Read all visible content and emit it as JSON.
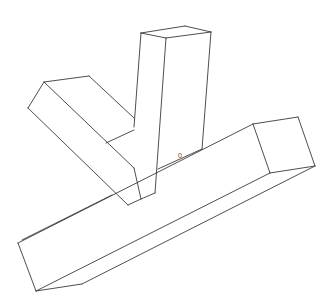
{
  "diagram": {
    "type": "line-drawing",
    "background": "#ffffff",
    "stroke_color": "#3a3a3a",
    "parts": [
      {
        "name": "horizontal-beam",
        "faces": [
          [
            [
              18,
              243
            ],
            [
              253,
              124
            ],
            [
              270,
              173
            ],
            [
              36,
              291
            ]
          ],
          [
            [
              36,
              291
            ],
            [
              270,
              173
            ],
            [
              315,
              166
            ],
            [
              82,
              284
            ]
          ],
          [
            [
              253,
              124
            ],
            [
              298,
              117
            ],
            [
              315,
              166
            ],
            [
              270,
              173
            ]
          ]
        ]
      },
      {
        "name": "diagonal-beam",
        "faces": [
          [
            [
              28,
              108
            ],
            [
              44,
              82
            ],
            [
              134,
              170
            ],
            [
              128,
              205
            ]
          ],
          [
            [
              44,
              82
            ],
            [
              89,
              76
            ],
            [
              134,
              118
            ],
            [
              134,
              170
            ]
          ]
        ]
      },
      {
        "name": "vertical-beam",
        "faces": [
          [
            [
              141,
              33
            ],
            [
              166,
              38
            ],
            [
              155,
              193
            ],
            [
              141,
              199
            ],
            [
              128,
              205
            ],
            [
              134,
              118
            ]
          ],
          [
            [
              166,
              38
            ],
            [
              211,
              32
            ],
            [
              202,
              149
            ],
            [
              158,
              170
            ],
            [
              155,
              193
            ]
          ],
          [
            [
              141,
              33
            ],
            [
              185,
              26
            ],
            [
              211,
              32
            ],
            [
              166,
              38
            ]
          ]
        ]
      }
    ],
    "lines": [
      [
        [
          18,
          243
        ],
        [
          253,
          124
        ]
      ],
      [
        [
          253,
          124
        ],
        [
          298,
          117
        ]
      ],
      [
        [
          298,
          117
        ],
        [
          315,
          166
        ]
      ],
      [
        [
          315,
          166
        ],
        [
          270,
          173
        ]
      ],
      [
        [
          270,
          173
        ],
        [
          253,
          124
        ]
      ],
      [
        [
          270,
          173
        ],
        [
          36,
          291
        ]
      ],
      [
        [
          315,
          166
        ],
        [
          82,
          284
        ]
      ],
      [
        [
          82,
          284
        ],
        [
          36,
          291
        ]
      ],
      [
        [
          36,
          291
        ],
        [
          18,
          243
        ]
      ],
      [
        [
          141,
          33
        ],
        [
          185,
          26
        ]
      ],
      [
        [
          185,
          26
        ],
        [
          211,
          32
        ]
      ],
      [
        [
          211,
          32
        ],
        [
          166,
          38
        ]
      ],
      [
        [
          166,
          38
        ],
        [
          141,
          33
        ]
      ],
      [
        [
          141,
          33
        ],
        [
          134,
          127
        ]
      ],
      [
        [
          166,
          38
        ],
        [
          155,
          193
        ]
      ],
      [
        [
          211,
          32
        ],
        [
          202,
          149
        ]
      ],
      [
        [
          155,
          193
        ],
        [
          141,
          199
        ]
      ],
      [
        [
          28,
          108
        ],
        [
          44,
          82
        ]
      ],
      [
        [
          44,
          82
        ],
        [
          89,
          76
        ]
      ],
      [
        [
          89,
          76
        ],
        [
          134,
          118
        ]
      ],
      [
        [
          28,
          108
        ],
        [
          128,
          205
        ]
      ],
      [
        [
          44,
          82
        ],
        [
          134,
          168
        ]
      ],
      [
        [
          128,
          205
        ],
        [
          141,
          199
        ]
      ],
      [
        [
          106,
          143
        ],
        [
          134,
          130
        ]
      ],
      [
        [
          134,
          168
        ],
        [
          141,
          199
        ]
      ],
      [
        [
          202,
          149
        ],
        [
          158,
          169
        ]
      ],
      [
        [
          112,
          195
        ],
        [
          22,
          240
        ]
      ]
    ],
    "labels": [
      {
        "text": "0",
        "x": 178,
        "y": 158
      }
    ]
  }
}
